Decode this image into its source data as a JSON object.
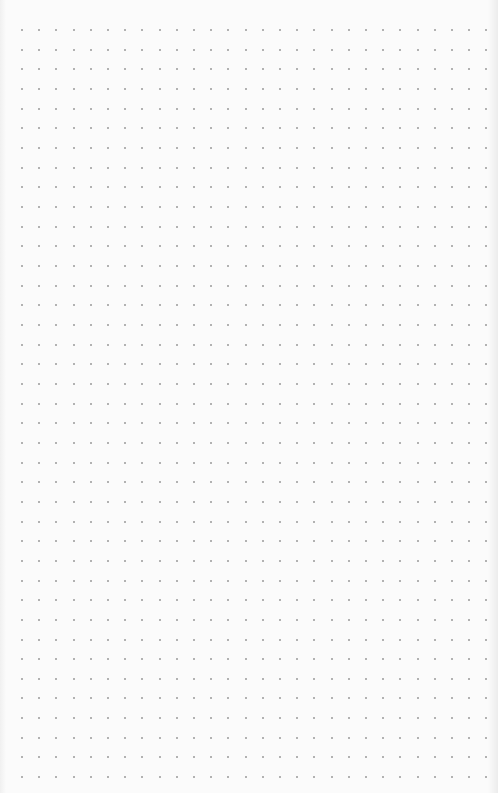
{
  "page": {
    "type": "dot-grid-paper",
    "background_color": "#fbfbfb",
    "dot_color": "#9a9a9a"
  },
  "grid": {
    "columns": 28,
    "rows": 39,
    "origin_x": 22,
    "origin_y": 30,
    "spacing_x": 17.2,
    "spacing_y": 19.66
  }
}
